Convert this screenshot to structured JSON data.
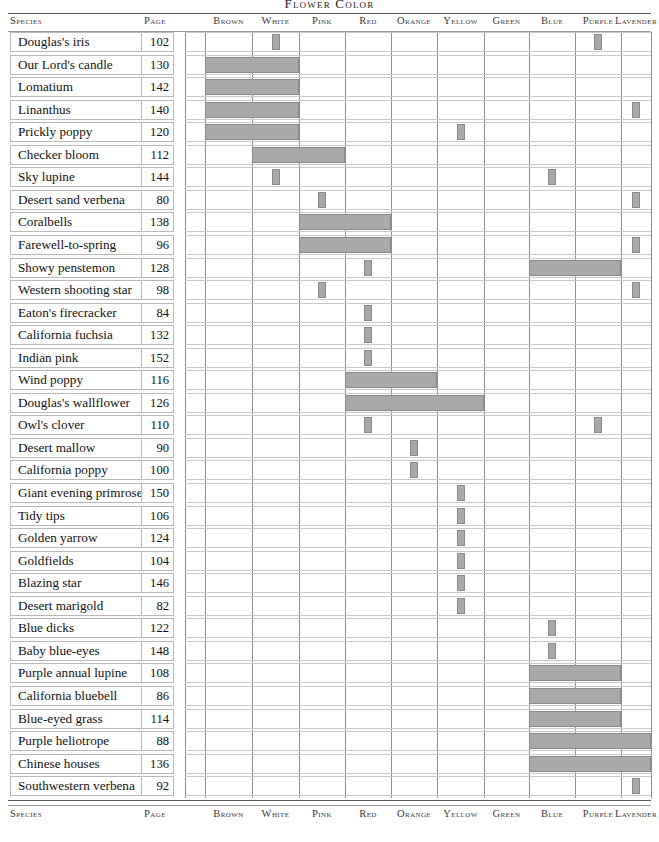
{
  "title": "FLOWER COLOR",
  "columns": {
    "species_header": "Species",
    "page_header": "Page",
    "colors": [
      "Brown",
      "White",
      "Pink",
      "Red",
      "Orange",
      "Yellow",
      "Green",
      "Blue",
      "Purple",
      "Lavender"
    ]
  },
  "chart_data": {
    "type": "bar",
    "title": "Flower Color",
    "xlabel": "",
    "ylabel": "Species",
    "grid": true,
    "legend": null,
    "categories": [
      "Brown",
      "White",
      "Pink",
      "Red",
      "Orange",
      "Yellow",
      "Green",
      "Blue",
      "Purple",
      "Lavender"
    ],
    "note": "Horizontal gray bars mark the color range each species' flowers span across the color spectrum columns.",
    "rows": [
      {
        "species": "Douglas's iris",
        "page": "102",
        "spans": [
          [
            "White",
            "White"
          ],
          [
            "Purple",
            "Purple"
          ]
        ]
      },
      {
        "species": "Our Lord's candle",
        "page": "130",
        "spans": [
          [
            "Brown",
            "White"
          ]
        ]
      },
      {
        "species": "Lomatium",
        "page": "142",
        "spans": [
          [
            "Brown",
            "White"
          ]
        ]
      },
      {
        "species": "Linanthus",
        "page": "140",
        "spans": [
          [
            "Brown",
            "White"
          ],
          [
            "Lavender",
            "Lavender"
          ]
        ]
      },
      {
        "species": "Prickly poppy",
        "page": "120",
        "spans": [
          [
            "Brown",
            "White"
          ],
          [
            "Yellow",
            "Yellow"
          ]
        ]
      },
      {
        "species": "Checker bloom",
        "page": "112",
        "spans": [
          [
            "White",
            "Pink"
          ]
        ]
      },
      {
        "species": "Sky lupine",
        "page": "144",
        "spans": [
          [
            "White",
            "White"
          ],
          [
            "Blue",
            "Blue"
          ]
        ]
      },
      {
        "species": "Desert sand verbena",
        "page": "80",
        "spans": [
          [
            "Pink",
            "Pink"
          ],
          [
            "Lavender",
            "Lavender"
          ]
        ]
      },
      {
        "species": "Coralbells",
        "page": "138",
        "spans": [
          [
            "Pink",
            "Red"
          ]
        ]
      },
      {
        "species": "Farewell-to-spring",
        "page": "96",
        "spans": [
          [
            "Pink",
            "Red"
          ],
          [
            "Lavender",
            "Lavender"
          ]
        ]
      },
      {
        "species": "Showy penstemon",
        "page": "128",
        "spans": [
          [
            "Red",
            "Red"
          ],
          [
            "Blue",
            "Purple"
          ]
        ]
      },
      {
        "species": "Western shooting star",
        "page": "98",
        "spans": [
          [
            "Pink",
            "Pink"
          ],
          [
            "Lavender",
            "Lavender"
          ]
        ]
      },
      {
        "species": "Eaton's firecracker",
        "page": "84",
        "spans": [
          [
            "Red",
            "Red"
          ]
        ]
      },
      {
        "species": "California fuchsia",
        "page": "132",
        "spans": [
          [
            "Red",
            "Red"
          ]
        ]
      },
      {
        "species": "Indian pink",
        "page": "152",
        "spans": [
          [
            "Red",
            "Red"
          ]
        ]
      },
      {
        "species": "Wind poppy",
        "page": "116",
        "spans": [
          [
            "Red",
            "Orange"
          ]
        ]
      },
      {
        "species": "Douglas's wallflower",
        "page": "126",
        "spans": [
          [
            "Red",
            "Yellow"
          ]
        ]
      },
      {
        "species": "Owl's clover",
        "page": "110",
        "spans": [
          [
            "Red",
            "Red"
          ],
          [
            "Purple",
            "Purple"
          ]
        ]
      },
      {
        "species": "Desert mallow",
        "page": "90",
        "spans": [
          [
            "Orange",
            "Orange"
          ]
        ]
      },
      {
        "species": "California poppy",
        "page": "100",
        "spans": [
          [
            "Orange",
            "Orange"
          ]
        ]
      },
      {
        "species": "Giant evening primrose",
        "page": "150",
        "spans": [
          [
            "Yellow",
            "Yellow"
          ]
        ]
      },
      {
        "species": "Tidy tips",
        "page": "106",
        "spans": [
          [
            "Yellow",
            "Yellow"
          ]
        ]
      },
      {
        "species": "Golden yarrow",
        "page": "124",
        "spans": [
          [
            "Yellow",
            "Yellow"
          ]
        ]
      },
      {
        "species": "Goldfields",
        "page": "104",
        "spans": [
          [
            "Yellow",
            "Yellow"
          ]
        ]
      },
      {
        "species": "Blazing star",
        "page": "146",
        "spans": [
          [
            "Yellow",
            "Yellow"
          ]
        ]
      },
      {
        "species": "Desert marigold",
        "page": "82",
        "spans": [
          [
            "Yellow",
            "Yellow"
          ]
        ]
      },
      {
        "species": "Blue dicks",
        "page": "122",
        "spans": [
          [
            "Blue",
            "Blue"
          ]
        ]
      },
      {
        "species": "Baby blue-eyes",
        "page": "148",
        "spans": [
          [
            "Blue",
            "Blue"
          ]
        ]
      },
      {
        "species": "Purple annual lupine",
        "page": "108",
        "spans": [
          [
            "Blue",
            "Purple"
          ]
        ]
      },
      {
        "species": "California bluebell",
        "page": "86",
        "spans": [
          [
            "Blue",
            "Purple"
          ]
        ]
      },
      {
        "species": "Blue-eyed grass",
        "page": "114",
        "spans": [
          [
            "Blue",
            "Purple"
          ]
        ]
      },
      {
        "species": "Purple heliotrope",
        "page": "88",
        "spans": [
          [
            "Blue",
            "Lavender"
          ]
        ]
      },
      {
        "species": "Chinese houses",
        "page": "136",
        "spans": [
          [
            "Blue",
            "Lavender"
          ]
        ]
      },
      {
        "species": "Southwestern verbena",
        "page": "92",
        "spans": [
          [
            "Lavender",
            "Lavender"
          ]
        ]
      }
    ]
  },
  "colors": {
    "bar_fill": "#a9a9a9",
    "bar_stroke": "#8a8a8a",
    "grid_line": "#8d8d8d",
    "row_line": "#c9c9c9",
    "rule": "#555555",
    "text": "#111111"
  }
}
